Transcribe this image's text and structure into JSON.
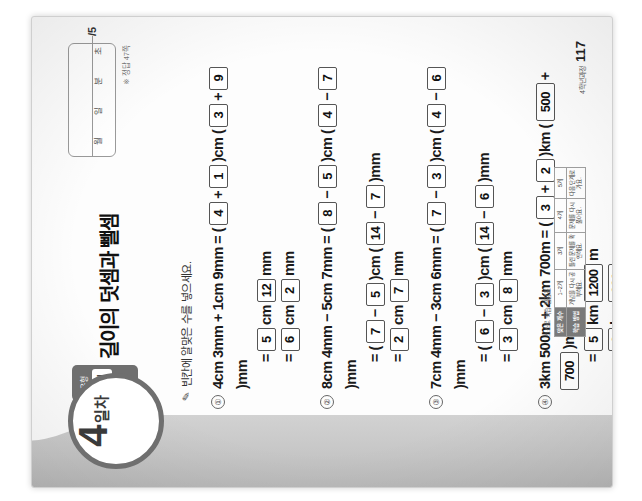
{
  "page": {
    "day_number": "4",
    "day_unit": "일차",
    "form_tab_sub": "유형",
    "form_tab_label": "B형",
    "title": "길이의 덧셈과 뺄셈",
    "answer_note": "※ 정답 47쪽",
    "instruction": "빈칸에 알맞은 수를 넣으세요.",
    "pencil_icon": "pencil-icon"
  },
  "datebox": {
    "month_label": "월",
    "day_label": "일",
    "minute_label": "분",
    "second_label": "초",
    "score": "/5"
  },
  "problems": [
    {
      "number": "①",
      "lines": [
        [
          {
            "t": "text",
            "v": "4cm 3mm + 1cm 9mm = ("
          },
          {
            "t": "box",
            "v": "4"
          },
          {
            "t": "text",
            "v": "+"
          },
          {
            "t": "box",
            "v": "1"
          },
          {
            "t": "text",
            "v": ")cm ("
          },
          {
            "t": "box",
            "v": "3"
          },
          {
            "t": "text",
            "v": "+"
          },
          {
            "t": "box",
            "v": "9"
          },
          {
            "t": "text",
            "v": ")mm"
          }
        ],
        [
          {
            "t": "text",
            "v": "="
          },
          {
            "t": "box",
            "v": "5"
          },
          {
            "t": "text",
            "v": "cm"
          },
          {
            "t": "box",
            "v": "12"
          },
          {
            "t": "text",
            "v": "mm"
          }
        ],
        [
          {
            "t": "text",
            "v": "="
          },
          {
            "t": "box",
            "v": "6"
          },
          {
            "t": "text",
            "v": "cm"
          },
          {
            "t": "box",
            "v": "2"
          },
          {
            "t": "text",
            "v": "mm"
          }
        ]
      ]
    },
    {
      "number": "②",
      "lines": [
        [
          {
            "t": "text",
            "v": "8cm 4mm − 5cm 7mm = ("
          },
          {
            "t": "box",
            "v": "8"
          },
          {
            "t": "text",
            "v": "−"
          },
          {
            "t": "box",
            "v": "5"
          },
          {
            "t": "text",
            "v": ")cm ("
          },
          {
            "t": "box",
            "v": "4"
          },
          {
            "t": "text",
            "v": "−"
          },
          {
            "t": "box",
            "v": "7"
          },
          {
            "t": "text",
            "v": ")mm"
          }
        ],
        [
          {
            "t": "text",
            "v": "= ("
          },
          {
            "t": "box",
            "v": "7"
          },
          {
            "t": "text",
            "v": "−"
          },
          {
            "t": "box",
            "v": "5"
          },
          {
            "t": "text",
            "v": ")cm ("
          },
          {
            "t": "box",
            "v": "14"
          },
          {
            "t": "text",
            "v": "−"
          },
          {
            "t": "box",
            "v": "7"
          },
          {
            "t": "text",
            "v": ")mm"
          }
        ],
        [
          {
            "t": "text",
            "v": "="
          },
          {
            "t": "box",
            "v": "2"
          },
          {
            "t": "text",
            "v": "cm"
          },
          {
            "t": "box",
            "v": "7"
          },
          {
            "t": "text",
            "v": "mm"
          }
        ]
      ]
    },
    {
      "number": "③",
      "lines": [
        [
          {
            "t": "text",
            "v": "7cm 4mm − 3cm 6mm = ("
          },
          {
            "t": "box",
            "v": "7"
          },
          {
            "t": "text",
            "v": "−"
          },
          {
            "t": "box",
            "v": "3"
          },
          {
            "t": "text",
            "v": ")cm ("
          },
          {
            "t": "box",
            "v": "4"
          },
          {
            "t": "text",
            "v": "−"
          },
          {
            "t": "box",
            "v": "6"
          },
          {
            "t": "text",
            "v": ")mm"
          }
        ],
        [
          {
            "t": "text",
            "v": "= ("
          },
          {
            "t": "box",
            "v": "6"
          },
          {
            "t": "text",
            "v": "−"
          },
          {
            "t": "box",
            "v": "3"
          },
          {
            "t": "text",
            "v": ")cm ("
          },
          {
            "t": "box",
            "v": "14"
          },
          {
            "t": "text",
            "v": "−"
          },
          {
            "t": "box",
            "v": "6"
          },
          {
            "t": "text",
            "v": ")mm"
          }
        ],
        [
          {
            "t": "text",
            "v": "="
          },
          {
            "t": "box",
            "v": "3"
          },
          {
            "t": "text",
            "v": "cm"
          },
          {
            "t": "box",
            "v": "8"
          },
          {
            "t": "text",
            "v": "mm"
          }
        ]
      ]
    },
    {
      "number": "④",
      "lines": [
        [
          {
            "t": "text",
            "v": "3km 500m + 2km 700m = ("
          },
          {
            "t": "box",
            "v": "3"
          },
          {
            "t": "text",
            "v": "+"
          },
          {
            "t": "box",
            "v": "2"
          },
          {
            "t": "text",
            "v": ")km ("
          },
          {
            "t": "box",
            "v": "500"
          },
          {
            "t": "text",
            "v": "+"
          },
          {
            "t": "box",
            "v": "700"
          },
          {
            "t": "text",
            "v": ")m"
          }
        ],
        [
          {
            "t": "text",
            "v": "="
          },
          {
            "t": "box",
            "v": "5"
          },
          {
            "t": "text",
            "v": "km"
          },
          {
            "t": "box",
            "v": "1200"
          },
          {
            "t": "text",
            "v": "m"
          }
        ],
        [
          {
            "t": "text",
            "v": "="
          },
          {
            "t": "box",
            "v": "6"
          },
          {
            "t": "text",
            "v": "km"
          },
          {
            "t": "box",
            "v": "200"
          },
          {
            "t": "text",
            "v": "m"
          }
        ]
      ]
    },
    {
      "number": "⑤",
      "lines": [
        [
          {
            "t": "text",
            "v": "8km 800m − 3km 900m = ("
          },
          {
            "t": "box",
            "v": "8"
          },
          {
            "t": "text",
            "v": "−"
          },
          {
            "t": "box",
            "v": "3"
          },
          {
            "t": "text",
            "v": ")km ("
          },
          {
            "t": "box",
            "v": "800"
          },
          {
            "t": "text",
            "v": "−"
          },
          {
            "t": "box",
            "v": "900"
          },
          {
            "t": "text",
            "v": ") m"
          }
        ],
        [
          {
            "t": "text",
            "v": "= ("
          },
          {
            "t": "box",
            "v": "7"
          },
          {
            "t": "text",
            "v": "−"
          },
          {
            "t": "box",
            "v": "3"
          },
          {
            "t": "text",
            "v": ")km ("
          },
          {
            "t": "box",
            "v": "1800"
          },
          {
            "t": "text",
            "v": "−"
          },
          {
            "t": "box",
            "v": "900"
          },
          {
            "t": "text",
            "v": ")m"
          }
        ],
        [
          {
            "t": "text",
            "v": "="
          },
          {
            "t": "box",
            "v": "4"
          },
          {
            "t": "text",
            "v": "km"
          },
          {
            "t": "box",
            "v": "900"
          },
          {
            "t": "text",
            "v": "m"
          }
        ]
      ]
    }
  ],
  "selfcheck": {
    "title": "스스로 학습 점검표",
    "rows": [
      {
        "head": "맞은 개수",
        "cells": [
          "1~2개",
          "3개",
          "4개",
          "5개"
        ]
      },
      {
        "head": "학습 방법",
        "cells": [
          "개념을 다시 공부해요.",
          "틀린 문제를 확인해요.",
          "문제를 다시 풀어요.",
          "다음 단계로 가요."
        ]
      }
    ]
  },
  "footer": {
    "label": "4학년과정",
    "page_number": "117"
  }
}
